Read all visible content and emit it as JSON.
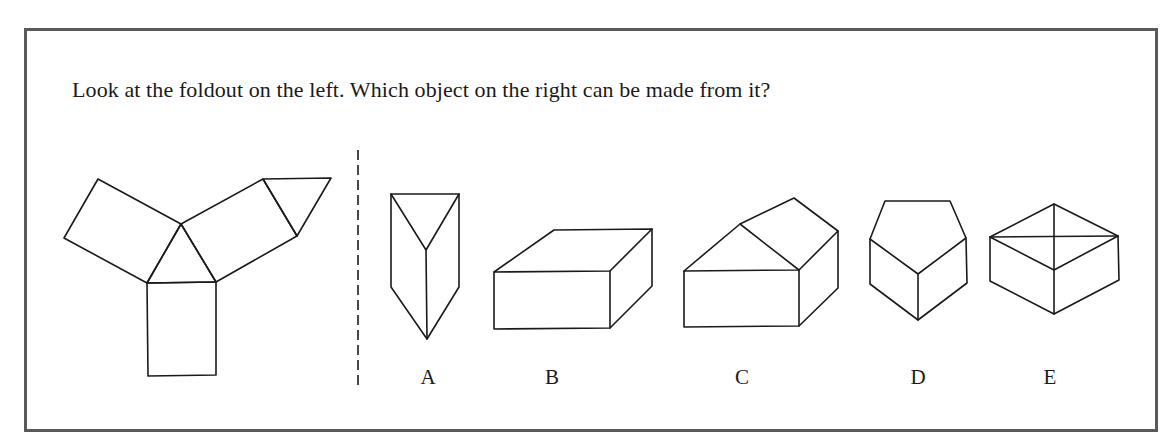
{
  "question": {
    "text": "Look at the foldout on the left. Which object on the right can be made from it?"
  },
  "foldout": {
    "name": "foldout-net",
    "faces": [
      {
        "name": "left-rectangle",
        "points": "98,179 64,238 147,283 181,224"
      },
      {
        "name": "center-triangle",
        "points": "181,224 147,283 216,282"
      },
      {
        "name": "right-rectangle",
        "points": "181,224 263,179 297,236 216,282"
      },
      {
        "name": "right-small-triangle",
        "points": "263,179 331,178 297,236"
      },
      {
        "name": "bottom-rectangle",
        "points": "147,283 216,282 216,375 148,376"
      }
    ]
  },
  "divider": {
    "x": 358,
    "y1": 150,
    "y2": 386
  },
  "options": [
    {
      "label": "A",
      "label_x": 428,
      "lines": [
        "391,194 459,194 459,287 427,339 391,287 391,194",
        "391,194 426,250 459,194",
        "426,250 427,339"
      ]
    },
    {
      "label": "B",
      "label_x": 552,
      "lines": [
        "494,272 554,230 652,229 652,286 610,328 494,329 494,272",
        "494,272 610,271 652,229",
        "610,271 610,328"
      ]
    },
    {
      "label": "C",
      "label_x": 742,
      "lines": [
        "684,271 740,224 794,198 838,231 838,288 799,326 684,327 684,271",
        "684,271 799,270 838,231",
        "740,224 799,270",
        "799,270 799,326"
      ]
    },
    {
      "label": "D",
      "label_x": 918,
      "lines": [
        "870,239 885,201 950,201 966,238 967,283 918,320 870,284 870,239",
        "870,239 918,274 966,238",
        "918,274 918,320"
      ]
    },
    {
      "label": "E",
      "label_x": 1050,
      "lines": [
        "990,237 1054,204 1118,236 1119,280 1054,314 990,281 990,237",
        "990,237 1054,270 1118,236",
        "990,237 1118,236",
        "1054,204 1054,314"
      ]
    }
  ],
  "colors": {
    "frame": "#5a5a5a",
    "ink": "#1a1a1a",
    "background": "#ffffff"
  }
}
